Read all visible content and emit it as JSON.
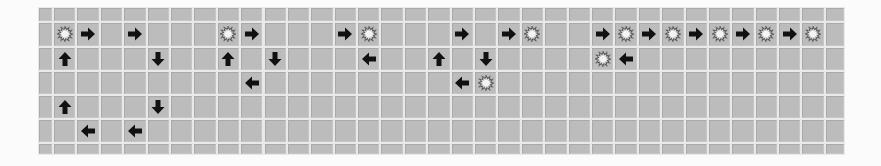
{
  "board": {
    "columns": 35,
    "rows": 7,
    "column_widths": [
      15,
      23.39,
      23.39,
      23.39,
      23.39,
      23.39,
      23.39,
      23.39,
      23.39,
      23.39,
      23.39,
      23.39,
      23.39,
      23.39,
      23.39,
      23.39,
      23.39,
      23.39,
      23.39,
      23.39,
      23.39,
      23.39,
      23.39,
      23.39,
      23.39,
      23.39,
      23.39,
      23.39,
      23.39,
      23.39,
      23.39,
      23.39,
      23.39,
      23.39,
      20
    ],
    "row_heights": [
      15,
      24.5,
      24,
      24,
      24,
      24,
      12.5
    ],
    "colors": {
      "cell": "#bcbcbc",
      "gridline": "#e9e9e9",
      "arrow": "#111111",
      "star_outline": "#5a5a5a",
      "star_fill": "#f4f4f4"
    },
    "pieces": [
      {
        "row": 1,
        "col": 1,
        "icon": "star"
      },
      {
        "row": 1,
        "col": 2,
        "icon": "arrow-right"
      },
      {
        "row": 1,
        "col": 4,
        "icon": "arrow-right"
      },
      {
        "row": 1,
        "col": 8,
        "icon": "star"
      },
      {
        "row": 1,
        "col": 9,
        "icon": "arrow-right"
      },
      {
        "row": 1,
        "col": 13,
        "icon": "arrow-right"
      },
      {
        "row": 1,
        "col": 14,
        "icon": "star"
      },
      {
        "row": 1,
        "col": 18,
        "icon": "arrow-right"
      },
      {
        "row": 1,
        "col": 20,
        "icon": "arrow-right"
      },
      {
        "row": 1,
        "col": 21,
        "icon": "star"
      },
      {
        "row": 1,
        "col": 24,
        "icon": "arrow-right"
      },
      {
        "row": 1,
        "col": 25,
        "icon": "star"
      },
      {
        "row": 1,
        "col": 26,
        "icon": "arrow-right"
      },
      {
        "row": 1,
        "col": 27,
        "icon": "star"
      },
      {
        "row": 1,
        "col": 28,
        "icon": "arrow-right"
      },
      {
        "row": 1,
        "col": 29,
        "icon": "star"
      },
      {
        "row": 1,
        "col": 30,
        "icon": "arrow-right"
      },
      {
        "row": 1,
        "col": 31,
        "icon": "star"
      },
      {
        "row": 1,
        "col": 32,
        "icon": "arrow-right"
      },
      {
        "row": 1,
        "col": 33,
        "icon": "star"
      },
      {
        "row": 2,
        "col": 1,
        "icon": "arrow-up"
      },
      {
        "row": 2,
        "col": 5,
        "icon": "arrow-down"
      },
      {
        "row": 2,
        "col": 8,
        "icon": "arrow-up"
      },
      {
        "row": 2,
        "col": 10,
        "icon": "arrow-down"
      },
      {
        "row": 2,
        "col": 14,
        "icon": "arrow-left"
      },
      {
        "row": 2,
        "col": 17,
        "icon": "arrow-up"
      },
      {
        "row": 2,
        "col": 19,
        "icon": "arrow-down"
      },
      {
        "row": 2,
        "col": 24,
        "icon": "star"
      },
      {
        "row": 2,
        "col": 25,
        "icon": "arrow-left"
      },
      {
        "row": 3,
        "col": 9,
        "icon": "arrow-left"
      },
      {
        "row": 3,
        "col": 18,
        "icon": "arrow-left"
      },
      {
        "row": 3,
        "col": 19,
        "icon": "star"
      },
      {
        "row": 4,
        "col": 1,
        "icon": "arrow-up"
      },
      {
        "row": 4,
        "col": 5,
        "icon": "arrow-down"
      },
      {
        "row": 5,
        "col": 2,
        "icon": "arrow-left"
      },
      {
        "row": 5,
        "col": 4,
        "icon": "arrow-left"
      }
    ]
  }
}
